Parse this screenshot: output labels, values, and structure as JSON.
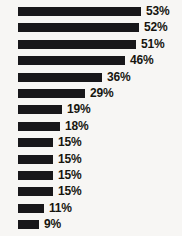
{
  "chart_data": {
    "type": "bar",
    "orientation": "horizontal",
    "title": "",
    "subtitle": "",
    "xlabel": "",
    "ylabel": "",
    "grid": false,
    "legend": null,
    "axis_visible": false,
    "value_suffix": "%",
    "xlim": [
      0,
      53
    ],
    "categories": [
      "",
      "",
      "",
      "",
      "",
      "",
      "",
      "",
      "",
      "",
      "",
      "",
      "",
      ""
    ],
    "values": [
      53,
      52,
      51,
      46,
      36,
      29,
      19,
      18,
      15,
      15,
      15,
      15,
      11,
      9
    ],
    "labels": [
      "53%",
      "52%",
      "51%",
      "46%",
      "36%",
      "29%",
      "19%",
      "18%",
      "15%",
      "15%",
      "15%",
      "15%",
      "11%",
      "9%"
    ],
    "bars": [
      {
        "value": 53,
        "label": "53%"
      },
      {
        "value": 52,
        "label": "52%"
      },
      {
        "value": 51,
        "label": "51%"
      },
      {
        "value": 46,
        "label": "46%"
      },
      {
        "value": 36,
        "label": "36%"
      },
      {
        "value": 29,
        "label": "29%"
      },
      {
        "value": 19,
        "label": "19%"
      },
      {
        "value": 18,
        "label": "18%"
      },
      {
        "value": 15,
        "label": "15%"
      },
      {
        "value": 15,
        "label": "15%"
      },
      {
        "value": 15,
        "label": "15%"
      },
      {
        "value": 15,
        "label": "15%"
      },
      {
        "value": 11,
        "label": "11%"
      },
      {
        "value": 9,
        "label": "9%"
      }
    ]
  },
  "colors": {
    "bar": "#18171a",
    "label_text": "#16150f",
    "background": "#f7f6f4"
  },
  "cropped_label_fragment": "t"
}
